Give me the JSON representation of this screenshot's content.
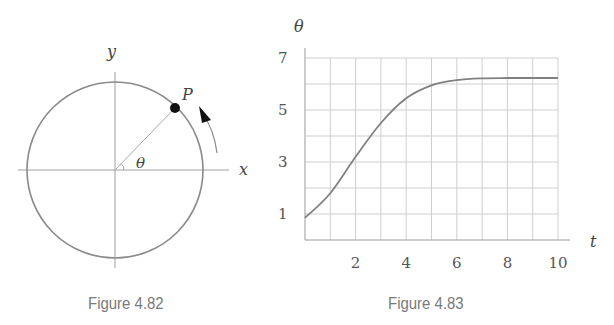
{
  "figures": [
    {
      "caption": "Figure 4.82",
      "labels": {
        "y_axis": "y",
        "x_axis": "x",
        "point": "P",
        "angle": "θ"
      }
    },
    {
      "caption": "Figure 4.83"
    }
  ],
  "colors": {
    "curve": "#808080",
    "grid": "#cfcfcf",
    "axis": "#9a9a9a",
    "caption": "#7a7a7a",
    "point": "#111111"
  },
  "chart_data": [
    {
      "type": "diagram",
      "title": "Figure 4.82",
      "description": "Unit circle with point P moving counterclockwise; angle θ measured from positive x-axis",
      "labels": [
        "x",
        "y",
        "P",
        "θ"
      ]
    },
    {
      "type": "line",
      "title": "Figure 4.83",
      "xlabel": "t",
      "ylabel": "θ",
      "xlim": [
        0,
        10
      ],
      "ylim": [
        0,
        7
      ],
      "xticks": [
        2,
        4,
        6,
        8,
        10
      ],
      "yticks": [
        1,
        3,
        5,
        7
      ],
      "grid": true,
      "x": [
        0,
        1,
        2,
        3,
        4,
        5,
        6,
        7,
        8,
        9,
        10
      ],
      "series": [
        {
          "name": "θ(t)",
          "values": [
            0.85,
            1.8,
            3.2,
            4.5,
            5.45,
            5.95,
            6.15,
            6.22,
            6.23,
            6.23,
            6.23
          ]
        }
      ]
    }
  ]
}
